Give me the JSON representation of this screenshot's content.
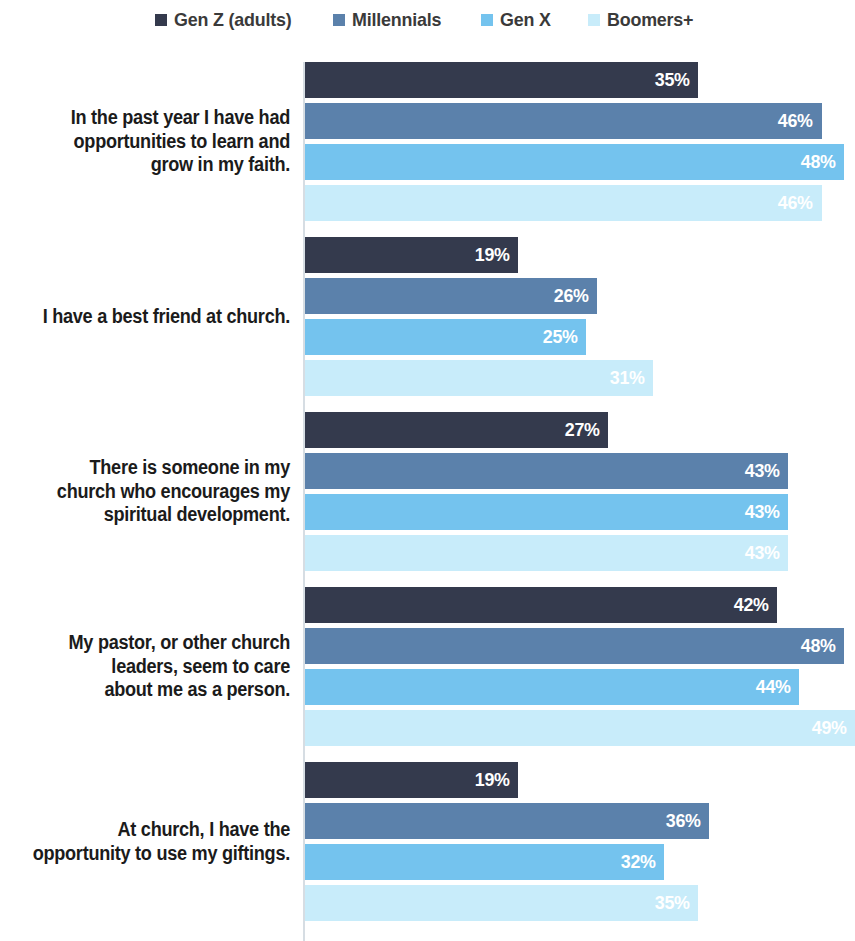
{
  "legend": {
    "entries": [
      {
        "label": "Gen Z (adults)",
        "color": "#343a4d"
      },
      {
        "label": "Millennials",
        "color": "#5b81ab"
      },
      {
        "label": "Gen X",
        "color": "#74c3ee"
      },
      {
        "label": "Boomers+",
        "color": "#c8ecfa"
      }
    ]
  },
  "chart_data": {
    "type": "bar",
    "orientation": "horizontal",
    "title": "",
    "subtitle": "",
    "xlabel": "",
    "ylabel": "",
    "xlim": [
      0,
      50
    ],
    "grid": false,
    "legend_position": "top-center",
    "value_suffix": "%",
    "categories": [
      "In the past year I have had opportunities to learn and grow in my faith.",
      "I have a best friend at church.",
      "There is someone in my church who encourages my spiritual development.",
      "My pastor, or other church leaders, seem to care about me as a person.",
      "At church, I have the opportunity to use my giftings."
    ],
    "series": [
      {
        "name": "Gen Z (adults)",
        "color": "#343a4d",
        "values": [
          35,
          19,
          27,
          42,
          19
        ]
      },
      {
        "name": "Millennials",
        "color": "#5b81ab",
        "values": [
          46,
          26,
          43,
          48,
          36
        ]
      },
      {
        "name": "Gen X",
        "color": "#74c3ee",
        "values": [
          48,
          25,
          43,
          44,
          32
        ]
      },
      {
        "name": "Boomers+",
        "color": "#c8ecfa",
        "values": [
          46,
          31,
          43,
          49,
          35
        ]
      }
    ],
    "groups": [
      {
        "label_lines": [
          "In the past year I have had",
          "opportunities to learn and",
          "grow in my faith."
        ],
        "bars": [
          {
            "series": "Gen Z (adults)",
            "value": 35,
            "value_label": "35%",
            "color": "#343a4d"
          },
          {
            "series": "Millennials",
            "value": 46,
            "value_label": "46%",
            "color": "#5b81ab"
          },
          {
            "series": "Gen X",
            "value": 48,
            "value_label": "48%",
            "color": "#74c3ee"
          },
          {
            "series": "Boomers+",
            "value": 46,
            "value_label": "46%",
            "color": "#c8ecfa"
          }
        ]
      },
      {
        "label_lines": [
          "I have a best friend at church."
        ],
        "bars": [
          {
            "series": "Gen Z (adults)",
            "value": 19,
            "value_label": "19%",
            "color": "#343a4d"
          },
          {
            "series": "Millennials",
            "value": 26,
            "value_label": "26%",
            "color": "#5b81ab"
          },
          {
            "series": "Gen X",
            "value": 25,
            "value_label": "25%",
            "color": "#74c3ee"
          },
          {
            "series": "Boomers+",
            "value": 31,
            "value_label": "31%",
            "color": "#c8ecfa"
          }
        ]
      },
      {
        "label_lines": [
          "There is someone in my",
          "church who encourages my",
          "spiritual development."
        ],
        "bars": [
          {
            "series": "Gen Z (adults)",
            "value": 27,
            "value_label": "27%",
            "color": "#343a4d"
          },
          {
            "series": "Millennials",
            "value": 43,
            "value_label": "43%",
            "color": "#5b81ab"
          },
          {
            "series": "Gen X",
            "value": 43,
            "value_label": "43%",
            "color": "#74c3ee"
          },
          {
            "series": "Boomers+",
            "value": 43,
            "value_label": "43%",
            "color": "#c8ecfa"
          }
        ]
      },
      {
        "label_lines": [
          "My pastor, or other church",
          "leaders, seem to care",
          "about me as a person."
        ],
        "bars": [
          {
            "series": "Gen Z (adults)",
            "value": 42,
            "value_label": "42%",
            "color": "#343a4d"
          },
          {
            "series": "Millennials",
            "value": 48,
            "value_label": "48%",
            "color": "#5b81ab"
          },
          {
            "series": "Gen X",
            "value": 44,
            "value_label": "44%",
            "color": "#74c3ee"
          },
          {
            "series": "Boomers+",
            "value": 49,
            "value_label": "49%",
            "color": "#c8ecfa"
          }
        ]
      },
      {
        "label_lines": [
          "At church, I have the",
          "opportunity to use my giftings."
        ],
        "bars": [
          {
            "series": "Gen Z (adults)",
            "value": 19,
            "value_label": "19%",
            "color": "#343a4d"
          },
          {
            "series": "Millennials",
            "value": 36,
            "value_label": "36%",
            "color": "#5b81ab"
          },
          {
            "series": "Gen X",
            "value": 32,
            "value_label": "32%",
            "color": "#74c3ee"
          },
          {
            "series": "Boomers+",
            "value": 35,
            "value_label": "35%",
            "color": "#c8ecfa"
          }
        ]
      }
    ]
  },
  "layout": {
    "group_tops": [
      22,
      197,
      372,
      547,
      722
    ],
    "bar_row_tops": [
      0,
      41,
      82,
      123
    ],
    "bar_height": 36,
    "px_per_unit": 11.23,
    "plot_left": 305
  }
}
